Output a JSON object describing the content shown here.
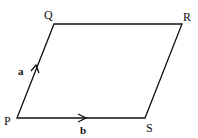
{
  "diagram": {
    "title": "",
    "shape": "parallelogram",
    "vertices": [
      {
        "name": "P",
        "x": 17,
        "y": 118
      },
      {
        "name": "Q",
        "x": 54,
        "y": 24
      },
      {
        "name": "R",
        "x": 182,
        "y": 24
      },
      {
        "name": "S",
        "x": 145,
        "y": 118
      }
    ],
    "labels": {
      "P": "P",
      "Q": "Q",
      "R": "R",
      "S": "S"
    },
    "vectors": [
      {
        "name": "a",
        "from": "P",
        "to": "Q",
        "label": "a"
      },
      {
        "name": "b",
        "from": "P",
        "to": "S",
        "label": "b"
      }
    ],
    "stroke_color": "#111111"
  }
}
